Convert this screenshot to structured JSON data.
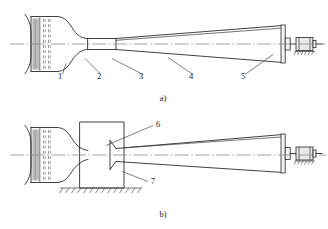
{
  "figure": {
    "background_color": "#ffffff",
    "line_color": "#2b2b2b",
    "centerline_color": "#8c8c8c"
  },
  "diagrams": [
    {
      "id": "diagram-a",
      "caption": "a)",
      "caption_x": 163,
      "caption_y": 101,
      "description": "open-circuit wind tunnel with bell mouth inlet, contraction, test section, diffuser and fan drive",
      "callouts": [
        {
          "number": "1",
          "label_x": 58,
          "label_y": 79,
          "leader": "M 62.5,74.5 L 66,63.5"
        },
        {
          "number": "2",
          "label_x": 97,
          "label_y": 79,
          "leader": "M 101,74.5 L 85,58.5"
        },
        {
          "number": "3",
          "label_x": 139,
          "label_y": 79,
          "leader": "M 143,74.5 L 112,58.5"
        },
        {
          "number": "4",
          "label_x": 189,
          "label_y": 79,
          "leader": "M 193,74.5 L 168,57.5"
        },
        {
          "number": "5",
          "label_x": 241,
          "label_y": 79,
          "leader": "M 245,74.5 L 273,54.5"
        }
      ]
    },
    {
      "id": "diagram-b",
      "caption": "b)",
      "caption_x": 163,
      "caption_y": 217,
      "description": "closed test chamber wind tunnel mounted on ground with open jet nozzle and collector",
      "callouts": [
        {
          "number": "6",
          "label_x": 156,
          "label_y": 127,
          "leader": "M 153,125.5 L 106,145.5"
        },
        {
          "number": "7",
          "label_x": 151,
          "label_y": 184,
          "leader": "M 148,181.5 L 122,171.5"
        }
      ]
    }
  ],
  "legend_numbers": [
    "1",
    "2",
    "3",
    "4",
    "5",
    "6",
    "7"
  ],
  "icons": {
    "motor": "motor-icon",
    "fan": "fan-icon",
    "ground": "ground-hatch-icon",
    "honeycomb": "honeycomb-screen-icon"
  }
}
